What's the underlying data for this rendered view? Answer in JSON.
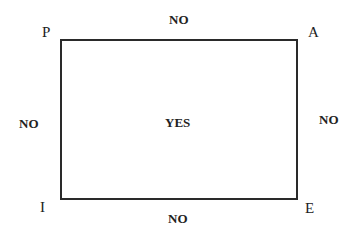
{
  "corners": {
    "top_left": "P",
    "top_right": "A",
    "bottom_left": "I",
    "bottom_right": "E"
  },
  "edges": {
    "top": "NO",
    "right": "NO",
    "bottom": "NO",
    "left": "NO"
  },
  "center": "YES"
}
